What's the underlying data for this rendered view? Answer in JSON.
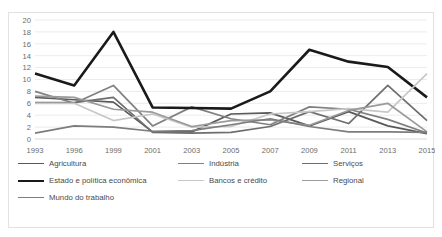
{
  "chart_data": {
    "type": "line",
    "title": "",
    "subtitle": "",
    "xlabel": "",
    "ylabel": "",
    "ylim": [
      0,
      20
    ],
    "ytick_step": 2,
    "yticks": [
      "0",
      "2",
      "4",
      "6",
      "8",
      "10",
      "12",
      "14",
      "16",
      "18",
      "20"
    ],
    "grid": true,
    "legend_position": "bottom",
    "categories": [
      "1993",
      "1996",
      "1999",
      "2001",
      "2003",
      "2005",
      "2007",
      "2009",
      "2011",
      "2013",
      "2015"
    ],
    "series": [
      {
        "name": "Agricultura",
        "color": "#595959",
        "width": 1.7,
        "values": [
          7,
          6.6,
          6.2,
          1.2,
          1.2,
          4.2,
          4.4,
          2.2,
          4.6,
          2.2,
          0.9
        ]
      },
      {
        "name": "Indústria",
        "color": "#808080",
        "width": 1.7,
        "values": [
          8,
          6,
          9,
          2.2,
          5.4,
          3.4,
          2.4,
          5.4,
          5,
          3.3,
          1
        ]
      },
      {
        "name": "Serviços",
        "color": "#6e6e6e",
        "width": 1.7,
        "values": [
          6.1,
          6.1,
          7,
          1.1,
          1,
          1.1,
          2.1,
          4.6,
          2.6,
          9,
          3.1
        ]
      },
      {
        "name": "Estado e política econômica",
        "color": "#1a1a1a",
        "width": 2.6,
        "values": [
          11,
          9,
          18,
          5.3,
          5.2,
          5.1,
          8,
          15,
          13,
          12.1,
          7
        ]
      },
      {
        "name": "Bancos e crédito",
        "color": "#c7c7c7",
        "width": 1.7,
        "values": [
          6,
          6,
          3.1,
          4.2,
          2,
          2.1,
          4.2,
          4.6,
          5.1,
          4.5,
          11
        ]
      },
      {
        "name": "Regional",
        "color": "#9a9a9a",
        "width": 1.7,
        "values": [
          7.2,
          7,
          5,
          4.5,
          2.1,
          3.1,
          3.2,
          2.3,
          4.8,
          6,
          1.2
        ]
      },
      {
        "name": "Mundo do trabalho",
        "color": "#7d7d7d",
        "width": 1.7,
        "values": [
          1,
          2.2,
          2,
          1.3,
          1.4,
          2.4,
          3.4,
          2.1,
          1.2,
          1.2,
          1.1
        ]
      }
    ]
  },
  "legend": {
    "items": [
      {
        "label": "Agricultura",
        "color": "#595959",
        "width": 1.7
      },
      {
        "label": "Indústria",
        "color": "#808080",
        "width": 1.7
      },
      {
        "label": "Serviços",
        "color": "#6e6e6e",
        "width": 1.7
      },
      {
        "label": "Estado e política econômica",
        "color": "#1a1a1a",
        "width": 2.6
      },
      {
        "label": "Bancos e crédito",
        "color": "#c7c7c7",
        "width": 1.7
      },
      {
        "label": "Regional",
        "color": "#9a9a9a",
        "width": 1.7
      },
      {
        "label": "Mundo do trabalho",
        "color": "#7d7d7d",
        "width": 1.7
      }
    ]
  }
}
